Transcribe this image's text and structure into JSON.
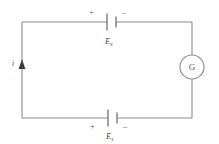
{
  "figure": {
    "type": "circuit-diagram",
    "background_color": "#ffffff",
    "line_color": "#8a8a8a",
    "text_color": "#555555"
  },
  "loop": {
    "left_x": 22,
    "right_x": 192,
    "top_y": 22,
    "bottom_y": 118
  },
  "top_branch": {
    "cell": {
      "name": "battery-cell-top",
      "long_plate_x": 107,
      "short_plate_x": 116,
      "center_x": 111.5,
      "wire_y": 22
    },
    "plus_label": "+",
    "minus_label": "–",
    "emf_label": "E",
    "emf_subscript": "x"
  },
  "bottom_branch": {
    "cell": {
      "name": "battery-cell-bottom",
      "long_plate_x": 108,
      "short_plate_x": 117,
      "center_x": 112.5,
      "wire_y": 118
    },
    "plus_label": "+",
    "minus_label": "–",
    "emf_label": "E",
    "emf_subscript": "s"
  },
  "left_branch": {
    "current_label": "i",
    "arrow_direction": "up",
    "arrow_y": 66
  },
  "right_branch": {
    "meter_label": "G",
    "meter_name": "galvanometer",
    "center_x": 192,
    "center_y": 67,
    "radius": 12
  }
}
